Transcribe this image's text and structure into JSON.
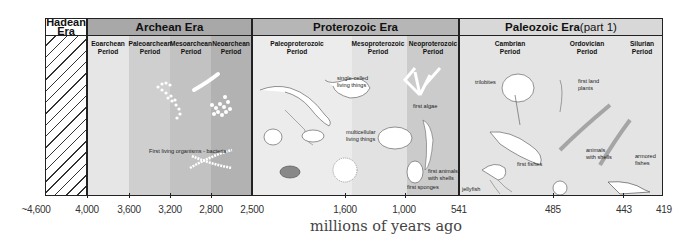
{
  "colors": {
    "hadean_header": "#ffffff",
    "archean_header": "#a8a8a8",
    "proterozoic_header": "#b6b6b6",
    "paleozoic_header": "#d8d8d8",
    "eoarchean": "#e6e6e6",
    "paleoarchean": "#cfcfcf",
    "mesoarchean": "#c2c2c2",
    "neoarchean": "#b2b2b2",
    "paleoproterozoic": "#ececec",
    "mesoproterozoic": "#e2e2e2",
    "neoproterozoic": "#cbcbcb",
    "paleozoic": "#e4e4e4",
    "border": "#222222"
  },
  "eras": [
    {
      "name": "Hadean\nEra",
      "id": "hadean"
    },
    {
      "name": "Archean Era",
      "id": "archean"
    },
    {
      "name": "Proterozoic Era",
      "id": "proterozoic"
    },
    {
      "name": "Paleozoic Era",
      "suffix": " (part 1)",
      "id": "paleozoic"
    }
  ],
  "periods": [
    {
      "name": "Eoarchean\nPeriod"
    },
    {
      "name": "Paleoarchean\nPeriod"
    },
    {
      "name": "Mesoarchean\nPeriod"
    },
    {
      "name": "Neoarchean\nPeriod"
    },
    {
      "name": "Paleoproterozoic\nPeriod"
    },
    {
      "name": "Mesoproterozoic\nPeriod"
    },
    {
      "name": "Neoproterozoic\nPeriod"
    },
    {
      "name": "Cambrian\nPeriod"
    },
    {
      "name": "Ordovician\nPeriod"
    },
    {
      "name": "Silurian\nPeriod"
    }
  ],
  "annotations": {
    "bacteria": "First living organisms - bacteria",
    "single_celled": "single-celled\nliving things",
    "multicellular": "multicellular\nliving things",
    "first_algae": "first algae",
    "first_animals_shells": "first animals\nwith shells",
    "first_sponges": "first sponges",
    "trilobites": "trilobites",
    "first_fishes": "first fishes",
    "jellyfish": "jellyfish",
    "first_land_plants": "first land\nplants",
    "animals_with_shells": "animals\nwith shells",
    "armored_fishes": "armored\nfishes"
  },
  "axis": {
    "ticks": [
      "~4,600",
      "4,000",
      "3,600",
      "3,200",
      "2,800",
      "2,500",
      "1,600",
      "1,000",
      "541",
      "485",
      "443",
      "419"
    ],
    "title": "millions of years ago"
  }
}
